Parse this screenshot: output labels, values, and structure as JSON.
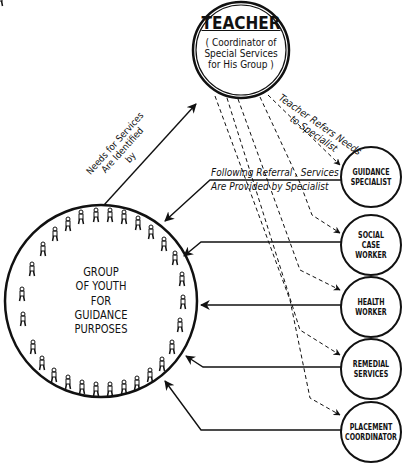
{
  "teacher": {
    "title": "TEACHER",
    "subtitle_lines": [
      "( Coordinator of",
      "Special Services",
      "for His Group )"
    ]
  },
  "group": {
    "lines": [
      "GROUP",
      "OF YOUTH",
      "FOR",
      "GUIDANCE",
      "PURPOSES"
    ]
  },
  "specialists": [
    {
      "lines": [
        "GUIDANCE",
        "SPECIALIST"
      ]
    },
    {
      "lines": [
        "SOCIAL",
        "CASE",
        "WORKER"
      ]
    },
    {
      "lines": [
        "HEALTH",
        "WORKER"
      ]
    },
    {
      "lines": [
        "REMEDIAL",
        "SERVICES"
      ]
    },
    {
      "lines": [
        "PLACEMENT",
        "COORDINATOR"
      ]
    }
  ],
  "annotations": {
    "needs": [
      "Needs for Services",
      "Are Identified",
      "by"
    ],
    "refers": [
      "Teacher Refers Needs",
      "to Specialist"
    ],
    "following": [
      "Following Referral , Services",
      "Are Provided by Specialist"
    ]
  },
  "colors": {
    "ink": "#111111",
    "background": "#ffffff"
  }
}
